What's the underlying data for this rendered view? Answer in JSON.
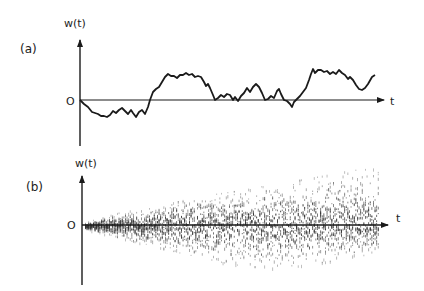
{
  "chart_data": [
    {
      "panel": "(a)",
      "type": "line",
      "title": "",
      "ylabel": "w(t)",
      "xlabel": "t",
      "origin_label": "O",
      "grid": false,
      "legend": null,
      "description": "Single random-walk (Wiener process) sample path starting at 0",
      "points_px": [
        [
          80,
          100
        ],
        [
          84,
          104
        ],
        [
          88,
          107
        ],
        [
          92,
          112
        ],
        [
          95,
          113
        ],
        [
          98,
          114
        ],
        [
          101,
          116
        ],
        [
          104,
          116
        ],
        [
          107,
          117
        ],
        [
          110,
          115
        ],
        [
          113,
          111
        ],
        [
          116,
          113
        ],
        [
          119,
          110
        ],
        [
          122,
          108
        ],
        [
          125,
          111
        ],
        [
          128,
          114
        ],
        [
          131,
          110
        ],
        [
          133,
          113
        ],
        [
          136,
          117
        ],
        [
          139,
          112
        ],
        [
          142,
          110
        ],
        [
          145,
          114
        ],
        [
          148,
          107
        ],
        [
          150,
          100
        ],
        [
          153,
          92
        ],
        [
          156,
          89
        ],
        [
          159,
          87
        ],
        [
          162,
          82
        ],
        [
          165,
          77
        ],
        [
          168,
          74
        ],
        [
          171,
          76
        ],
        [
          174,
          76
        ],
        [
          177,
          78
        ],
        [
          180,
          75
        ],
        [
          183,
          75
        ],
        [
          186,
          73
        ],
        [
          189,
          75
        ],
        [
          192,
          74
        ],
        [
          195,
          77
        ],
        [
          198,
          76
        ],
        [
          201,
          77
        ],
        [
          204,
          82
        ],
        [
          206,
          86
        ],
        [
          208,
          84
        ],
        [
          210,
          88
        ],
        [
          213,
          95
        ],
        [
          215,
          100
        ],
        [
          218,
          98
        ],
        [
          221,
          95
        ],
        [
          224,
          97
        ],
        [
          227,
          94
        ],
        [
          230,
          95
        ],
        [
          233,
          100
        ],
        [
          235,
          97
        ],
        [
          238,
          101
        ],
        [
          241,
          96
        ],
        [
          244,
          93
        ],
        [
          247,
          88
        ],
        [
          250,
          92
        ],
        [
          253,
          87
        ],
        [
          256,
          84
        ],
        [
          259,
          87
        ],
        [
          262,
          93
        ],
        [
          265,
          100
        ],
        [
          268,
          99
        ],
        [
          271,
          96
        ],
        [
          274,
          98
        ],
        [
          277,
          91
        ],
        [
          279,
          89
        ],
        [
          281,
          94
        ],
        [
          284,
          100
        ],
        [
          287,
          101
        ],
        [
          290,
          104
        ],
        [
          292,
          107
        ],
        [
          294,
          102
        ],
        [
          297,
          99
        ],
        [
          300,
          96
        ],
        [
          303,
          92
        ],
        [
          306,
          88
        ],
        [
          309,
          80
        ],
        [
          311,
          74
        ],
        [
          313,
          69
        ],
        [
          315,
          73
        ],
        [
          318,
          70
        ],
        [
          321,
          70
        ],
        [
          324,
          72
        ],
        [
          327,
          71
        ],
        [
          330,
          74
        ],
        [
          333,
          72
        ],
        [
          336,
          74
        ],
        [
          339,
          70
        ],
        [
          342,
          73
        ],
        [
          345,
          75
        ],
        [
          348,
          79
        ],
        [
          350,
          77
        ],
        [
          353,
          80
        ],
        [
          356,
          85
        ],
        [
          359,
          89
        ],
        [
          362,
          90
        ],
        [
          365,
          88
        ],
        [
          368,
          84
        ],
        [
          372,
          77
        ],
        [
          375,
          75
        ]
      ],
      "y_at_t_end": "positive",
      "zero_crossings_approx_px": [
        150,
        215,
        233,
        265,
        285,
        297
      ]
    },
    {
      "panel": "(b)",
      "type": "scatter",
      "title": "",
      "ylabel": "w(t)",
      "xlabel": "t",
      "origin_label": "O",
      "grid": false,
      "legend": null,
      "description": "Ensemble of many sample paths shown as dot density; spread grows with t (envelope ~ sqrt(t))",
      "envelope_px": {
        "t_start_x": 85,
        "t_end_x": 378,
        "axis_y": 225,
        "upper": [
          [
            85,
            222
          ],
          [
            120,
            212
          ],
          [
            160,
            205
          ],
          [
            200,
            196
          ],
          [
            240,
            190
          ],
          [
            280,
            183
          ],
          [
            320,
            176
          ],
          [
            350,
            170
          ],
          [
            378,
            168
          ]
        ],
        "lower": [
          [
            85,
            228
          ],
          [
            120,
            238
          ],
          [
            160,
            247
          ],
          [
            200,
            258
          ],
          [
            240,
            265
          ],
          [
            280,
            268
          ],
          [
            320,
            262
          ],
          [
            350,
            258
          ],
          [
            378,
            252
          ]
        ]
      }
    }
  ],
  "panels": {
    "a": {
      "tag": "(a)",
      "ylabel": "w(t)",
      "xlabel": "t",
      "origin": "O"
    },
    "b": {
      "tag": "(b)",
      "ylabel": "w(t)",
      "xlabel": "t",
      "origin": "O"
    }
  },
  "colors": {
    "ink": "#1a1a1a",
    "dots": "#333333",
    "background": "#ffffff"
  }
}
